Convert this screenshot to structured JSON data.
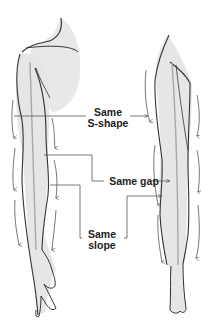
{
  "figure": {
    "subjects": [
      "arm",
      "leg"
    ],
    "colors": {
      "outline": "#333333",
      "shading": "#e6e6e6",
      "centerline": "#a8a8a8",
      "flow_arrows": "#555555",
      "leader_lines": "#555555",
      "label_text": "#222222"
    }
  },
  "annotations": {
    "s_shape": {
      "line1": "Same",
      "line2": "S-shape"
    },
    "gap": {
      "text": "Same gap"
    },
    "slope": {
      "line1": "Same",
      "line2": "slope"
    }
  }
}
